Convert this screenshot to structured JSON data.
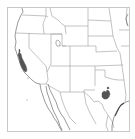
{
  "map": {
    "title": "Species range map — Western United States",
    "region": "Western & South-Central United States with northern Mexico",
    "colors": {
      "background": "#ffffff",
      "frame": "#c8c8c8",
      "state_border": "#9a9a9a",
      "coastline": "#6e6e6e",
      "range_fill": "#555555"
    },
    "range_areas": [
      {
        "name": "Central California",
        "label": "range-california"
      },
      {
        "name": "Central Texas (Edwards Plateau)",
        "label": "range-texas"
      }
    ],
    "features": [
      "state boundaries",
      "Pacific coastline",
      "Gulf of California",
      "Baja California peninsula",
      "Gulf of Mexico coastline",
      "Great Salt Lake"
    ]
  }
}
